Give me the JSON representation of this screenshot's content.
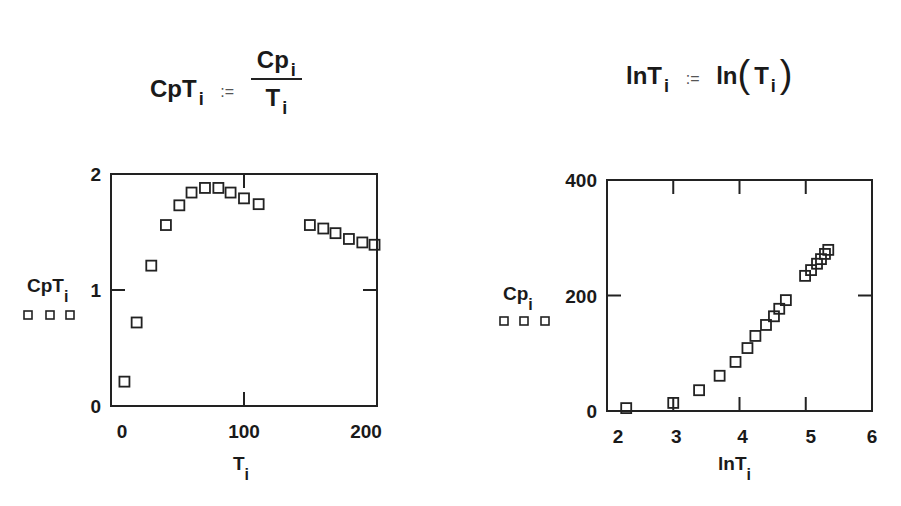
{
  "equations": {
    "left": {
      "lhs": "CpT",
      "lhs_sub": "i",
      "assign": ":=",
      "num": "Cp",
      "num_sub": "i",
      "den": "T",
      "den_sub": "i"
    },
    "right": {
      "lhs": "lnT",
      "lhs_sub": "i",
      "assign": ":=",
      "func": "ln",
      "arg": "T",
      "arg_sub": "i"
    }
  },
  "chart_data": [
    {
      "type": "scatter",
      "title": "",
      "xlabel": "T_i",
      "ylabel": "CpT_i",
      "xlim": [
        -9,
        209
      ],
      "ylim": [
        0,
        2
      ],
      "xticks": [
        0,
        100,
        200
      ],
      "yticks": [
        0,
        1,
        2
      ],
      "grid": false,
      "legend": {
        "marker": "square",
        "position": "left, below y-label"
      },
      "series": [
        {
          "name": "CpT_i",
          "marker": "square",
          "x": [
            2,
            12,
            24,
            36,
            47,
            57,
            68,
            79,
            89,
            100,
            112,
            154,
            165,
            175,
            186,
            197,
            207
          ],
          "y": [
            0.21,
            0.72,
            1.21,
            1.56,
            1.73,
            1.84,
            1.88,
            1.88,
            1.84,
            1.79,
            1.74,
            1.56,
            1.53,
            1.49,
            1.44,
            1.41,
            1.39
          ]
        }
      ]
    },
    {
      "type": "scatter",
      "title": "",
      "xlabel": "lnT_i",
      "ylabel": "Cp_i",
      "xlim": [
        2,
        6
      ],
      "ylim": [
        0,
        400
      ],
      "xticks": [
        2,
        3,
        4,
        5,
        6
      ],
      "yticks": [
        0,
        200,
        400
      ],
      "grid": false,
      "legend": {
        "marker": "square",
        "position": "left, below y-label"
      },
      "series": [
        {
          "name": "Cp_i",
          "marker": "square",
          "x": [
            2.29,
            3.0,
            3.39,
            3.7,
            3.94,
            4.12,
            4.24,
            4.4,
            4.52,
            4.6,
            4.7,
            4.99,
            5.08,
            5.17,
            5.23,
            5.29,
            5.34
          ],
          "y": [
            5,
            14,
            36,
            61,
            85,
            109,
            130,
            149,
            164,
            177,
            192,
            234,
            244,
            255,
            263,
            272,
            279
          ]
        }
      ]
    }
  ],
  "plots": [
    {
      "frame": {
        "left": 111,
        "right": 377,
        "top": 174,
        "bottom": 406
      },
      "xmap": {
        "v0": 0,
        "p0": 122,
        "v1": 200,
        "p1": 366
      },
      "ymap": {
        "v0": 0,
        "p0": 406,
        "v1": 2,
        "p1": 174
      },
      "tick_labels_x": [
        {
          "text": "0",
          "v": 0
        },
        {
          "text": "100",
          "v": 100
        },
        {
          "text": "200",
          "v": 200
        }
      ],
      "tick_labels_y": [
        {
          "text": "0",
          "v": 0
        },
        {
          "text": "1",
          "v": 1
        },
        {
          "text": "2",
          "v": 2
        }
      ],
      "inner_ticks_x": [
        100
      ],
      "inner_ticks_y": [
        1
      ],
      "xlabel": {
        "text": "T",
        "sub": "i",
        "x": 233,
        "y": 470
      },
      "ylabel": {
        "text": "CpT",
        "sub": "i",
        "x": 27,
        "y": 292
      },
      "legend_y": 315,
      "legend_x": [
        28,
        50,
        70
      ]
    },
    {
      "frame": {
        "left": 607,
        "right": 872,
        "top": 180,
        "bottom": 411
      },
      "xmap": {
        "v0": 2,
        "p0": 607,
        "v1": 6,
        "p1": 872
      },
      "ymap": {
        "v0": 0,
        "p0": 411,
        "v1": 400,
        "p1": 180
      },
      "tick_labels_x": [
        {
          "text": "2",
          "v": 2,
          "dx": 11
        },
        {
          "text": "3",
          "v": 3,
          "dx": 3
        },
        {
          "text": "4",
          "v": 4,
          "dx": 3
        },
        {
          "text": "5",
          "v": 5,
          "dx": 5
        },
        {
          "text": "6",
          "v": 6,
          "dx": 0
        }
      ],
      "tick_labels_y": [
        {
          "text": "0",
          "v": 0
        },
        {
          "text": "200",
          "v": 200
        },
        {
          "text": "400",
          "v": 400
        }
      ],
      "inner_ticks_x": [
        3,
        4,
        5
      ],
      "inner_ticks_y": [
        200
      ],
      "xlabel": {
        "text": "lnT",
        "sub": "i",
        "x": 718,
        "y": 470
      },
      "ylabel": {
        "text": "Cp",
        "sub": "i",
        "x": 503,
        "y": 300
      },
      "legend_y": 321,
      "legend_x": [
        504,
        524,
        545
      ]
    }
  ]
}
